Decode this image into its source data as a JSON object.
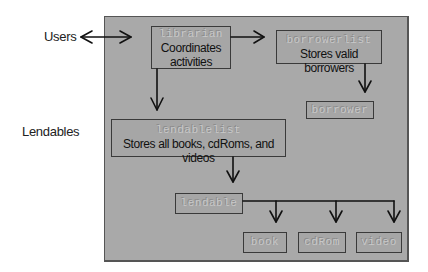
{
  "external_labels": {
    "users": "Users",
    "lendables": "Lendables"
  },
  "nodes": {
    "librarian": {
      "class_name": "librarian",
      "description_line1": "Coordinates",
      "description_line2": "activities"
    },
    "borrowerlist": {
      "class_name": "borrowerlist",
      "description": "Stores valid borrowers"
    },
    "borrower": {
      "class_name": "borrower"
    },
    "lendablelist": {
      "class_name": "lendablelist",
      "description": "Stores all books, cdRoms, and videos"
    },
    "lendable": {
      "class_name": "lendable"
    },
    "book": {
      "class_name": "book"
    },
    "cdRom": {
      "class_name": "cdRom"
    },
    "video": {
      "class_name": "video"
    }
  },
  "colors": {
    "container_fill": "#a9a9a9",
    "border": "#3a3a3a",
    "class_text": "#c8c8c8",
    "description_text": "#111111",
    "arrow": "#111111"
  },
  "edges": [
    {
      "from": "Users",
      "to": "librarian",
      "type": "bidirectional"
    },
    {
      "from": "librarian",
      "to": "borrowerlist"
    },
    {
      "from": "librarian",
      "to": "lendablelist"
    },
    {
      "from": "borrowerlist",
      "to": "borrower"
    },
    {
      "from": "lendablelist",
      "to": "lendable"
    },
    {
      "from": "lendable",
      "to": "book"
    },
    {
      "from": "lendable",
      "to": "cdRom"
    },
    {
      "from": "lendable",
      "to": "video"
    }
  ]
}
